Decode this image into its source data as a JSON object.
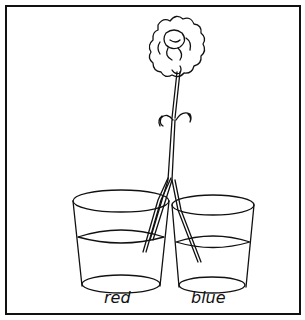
{
  "figure": {
    "labels": {
      "left_cup": "red",
      "right_cup": "blue"
    }
  }
}
